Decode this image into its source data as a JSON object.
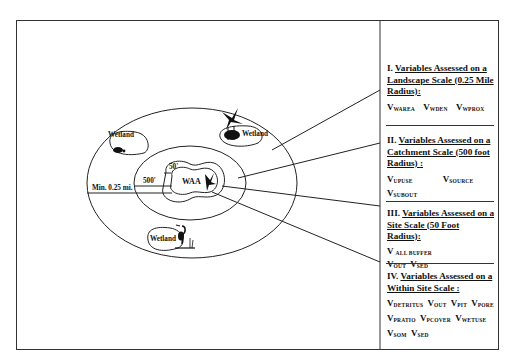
{
  "diagram": {
    "center_label": "WAA",
    "radius_labels": {
      "landscape": "Min. 0.25 mi.",
      "catchment": "500'",
      "site": "50'"
    },
    "wetlands": [
      {
        "label": "Wetland",
        "icon": "turtle-icon"
      },
      {
        "label": "Wetland",
        "icon": "bird-cattail-icon"
      },
      {
        "label": "Wetland",
        "icon": "heron-icon"
      }
    ],
    "colors": {
      "line": "#222222",
      "background": "#ffffff"
    }
  },
  "sections": [
    {
      "numeral": "I.",
      "title": "Variables Assessed on a Landscape Scale (0.25 Mile Radius):",
      "variables": [
        {
          "base": "V",
          "sub": "WAREA"
        },
        {
          "base": "V",
          "sub": "WDEN"
        },
        {
          "base": "V",
          "sub": "WPROX"
        }
      ]
    },
    {
      "numeral": "II.",
      "title": "Variables Assessed on a Catchment Scale (500 foot Radius) :",
      "variables": [
        {
          "base": "V",
          "sub": "UPUSE"
        },
        {
          "base": "V",
          "sub": "SOURCE"
        },
        {
          "base": "V",
          "sub": "SUBOUT"
        }
      ]
    },
    {
      "numeral": "III.",
      "title": "Variables Assessed on a Site Scale (50 Foot Radius):",
      "variables": [
        {
          "base": "V",
          "sub": "ALL BUFFER"
        },
        {
          "base": "V",
          "sub": "OUT"
        },
        {
          "base": "V",
          "sub": "SED"
        }
      ]
    },
    {
      "numeral": "IV.",
      "title": "Variables Assessed on a Within Site Scale :",
      "variables": [
        {
          "base": "V",
          "sub": "DETRITUS"
        },
        {
          "base": "V",
          "sub": "OUT"
        },
        {
          "base": "V",
          "sub": "PIT"
        },
        {
          "base": "V",
          "sub": "PORE"
        },
        {
          "base": "V",
          "sub": "PRATIO"
        },
        {
          "base": "V",
          "sub": "PCOVER"
        },
        {
          "base": "V",
          "sub": "WETUSE"
        },
        {
          "base": "V",
          "sub": "SOM"
        },
        {
          "base": "V",
          "sub": "SED"
        }
      ]
    }
  ]
}
